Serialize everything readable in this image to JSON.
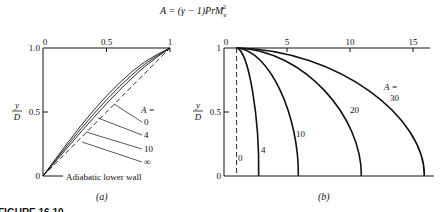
{
  "figure": {
    "formula_lhs": "A = (γ − 1)",
    "formula_pr": "Pr",
    "formula_m": "M",
    "formula_sub": "e",
    "formula_sup": "2",
    "caption": "FIGURE 16.10"
  },
  "chart_data": [
    {
      "panel": "(a)",
      "type": "line",
      "title": "",
      "xlabel": "",
      "ylabel": "y/D",
      "ylabel_num": "y",
      "ylabel_den": "D",
      "xlim": [
        0,
        1
      ],
      "ylim": [
        0,
        1
      ],
      "x_axis_position": "top",
      "xticks": [
        0,
        0.5,
        1
      ],
      "xtick_labels": [
        "0",
        "0.5",
        "1"
      ],
      "yticks": [
        0,
        0.5,
        1.0
      ],
      "ytick_labels": [
        "0",
        "0.5",
        "1.0"
      ],
      "legend_title": "A =",
      "annotation": "Adiabatic lower wall",
      "series": [
        {
          "name": "0",
          "style": "solid",
          "points": [
            [
              0,
              0
            ],
            [
              0.2,
              0.27
            ],
            [
              0.4,
              0.52
            ],
            [
              0.6,
              0.73
            ],
            [
              0.8,
              0.9
            ],
            [
              1,
              1
            ]
          ]
        },
        {
          "name": "4",
          "style": "solid",
          "points": [
            [
              0,
              0
            ],
            [
              0.2,
              0.25
            ],
            [
              0.4,
              0.49
            ],
            [
              0.6,
              0.7
            ],
            [
              0.8,
              0.88
            ],
            [
              1,
              1
            ]
          ]
        },
        {
          "name": "10",
          "style": "solid",
          "points": [
            [
              0,
              0
            ],
            [
              0.2,
              0.23
            ],
            [
              0.4,
              0.46
            ],
            [
              0.6,
              0.67
            ],
            [
              0.8,
              0.86
            ],
            [
              1,
              1
            ]
          ]
        },
        {
          "name": "∞",
          "style": "dashed",
          "points": [
            [
              0,
              0
            ],
            [
              0.2,
              0.2
            ],
            [
              0.4,
              0.4
            ],
            [
              0.6,
              0.6
            ],
            [
              0.8,
              0.8
            ],
            [
              1,
              1
            ]
          ]
        }
      ]
    },
    {
      "panel": "(b)",
      "type": "line",
      "title": "",
      "xlabel": "",
      "ylabel": "y/D",
      "ylabel_num": "y",
      "ylabel_den": "D",
      "xlim": [
        0,
        17
      ],
      "ylim": [
        0,
        1
      ],
      "x_axis_position": "top",
      "xticks": [
        0,
        5,
        10,
        15
      ],
      "xtick_labels": [
        "0",
        "5",
        "10",
        "15"
      ],
      "yticks": [
        0,
        0.5,
        1
      ],
      "ytick_labels": [
        "0",
        "0.5",
        "1"
      ],
      "legend_title": "A =",
      "series": [
        {
          "name": "0",
          "style": "dashed",
          "wall_value": 1.0,
          "points": [
            [
              1,
              1
            ],
            [
              1,
              0
            ]
          ]
        },
        {
          "name": "4",
          "style": "solid",
          "wall_value": 2.75,
          "points": [
            [
              1,
              1
            ],
            [
              1.8,
              0.75
            ],
            [
              2.4,
              0.5
            ],
            [
              2.7,
              0.25
            ],
            [
              2.75,
              0
            ]
          ]
        },
        {
          "name": "10",
          "style": "solid",
          "wall_value": 5.9,
          "points": [
            [
              1,
              1
            ],
            [
              3.2,
              0.75
            ],
            [
              4.8,
              0.5
            ],
            [
              5.7,
              0.25
            ],
            [
              5.9,
              0
            ]
          ]
        },
        {
          "name": "20",
          "style": "solid",
          "wall_value": 10.9,
          "points": [
            [
              1,
              1
            ],
            [
              5.5,
              0.75
            ],
            [
              8.7,
              0.5
            ],
            [
              10.4,
              0.25
            ],
            [
              10.9,
              0
            ]
          ]
        },
        {
          "name": "30",
          "style": "solid",
          "wall_value": 15.9,
          "points": [
            [
              1,
              1
            ],
            [
              7.8,
              0.75
            ],
            [
              12.6,
              0.5
            ],
            [
              15.1,
              0.25
            ],
            [
              15.9,
              0
            ]
          ]
        }
      ]
    }
  ]
}
